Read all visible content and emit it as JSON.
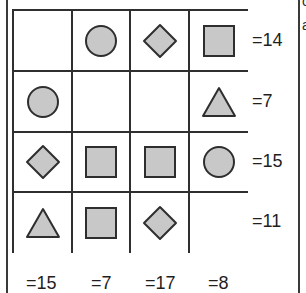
{
  "puzzle": {
    "shape_fill": "#c8c8c8",
    "shape_stroke": "#2e2e2e",
    "grid": [
      [
        "empty",
        "circle",
        "diamond",
        "square"
      ],
      [
        "circle",
        "empty",
        "empty",
        "triangle"
      ],
      [
        "diamond",
        "square",
        "square",
        "circle"
      ],
      [
        "triangle",
        "square",
        "diamond",
        "empty"
      ]
    ],
    "row_sums": [
      "=14",
      "=7",
      "=15",
      "=11"
    ],
    "col_sums": [
      "=15",
      "=7",
      "=17",
      "=8"
    ]
  },
  "edge_glyphs": [
    "c",
    "a"
  ]
}
